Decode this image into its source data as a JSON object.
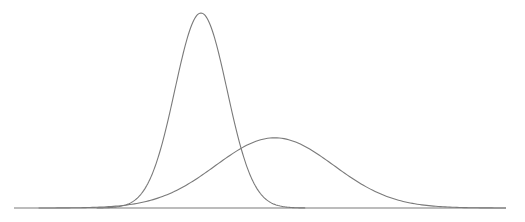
{
  "chart_data": {
    "type": "line",
    "title": "",
    "xlabel": "",
    "ylabel": "",
    "grid": false,
    "legend": "none",
    "xlim": [
      0,
      100
    ],
    "ylim": [
      0,
      1
    ],
    "series": [
      {
        "name": "narrow distribution",
        "distribution": "normal",
        "mean": 38,
        "sd": 5.3,
        "peak": 1.0
      },
      {
        "name": "wide distribution",
        "distribution": "normal",
        "mean": 53,
        "sd": 12,
        "peak": 0.36
      }
    ],
    "colors": {
      "line": "#7a7a7a",
      "baseline": "#7a7a7a"
    }
  }
}
